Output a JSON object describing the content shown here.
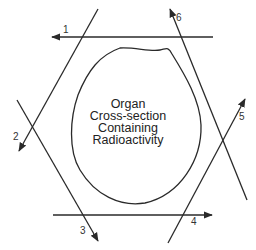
{
  "diagram": {
    "center_label": [
      "Organ",
      "Cross-section",
      "Containing",
      "Radioactivity"
    ],
    "projections": [
      {
        "id": 1,
        "label": "1"
      },
      {
        "id": 2,
        "label": "2"
      },
      {
        "id": 3,
        "label": "3"
      },
      {
        "id": 4,
        "label": "4"
      },
      {
        "id": 5,
        "label": "5"
      },
      {
        "id": 6,
        "label": "6"
      }
    ],
    "colors": {
      "line": "#2a2a2a",
      "background": "#ffffff"
    }
  }
}
